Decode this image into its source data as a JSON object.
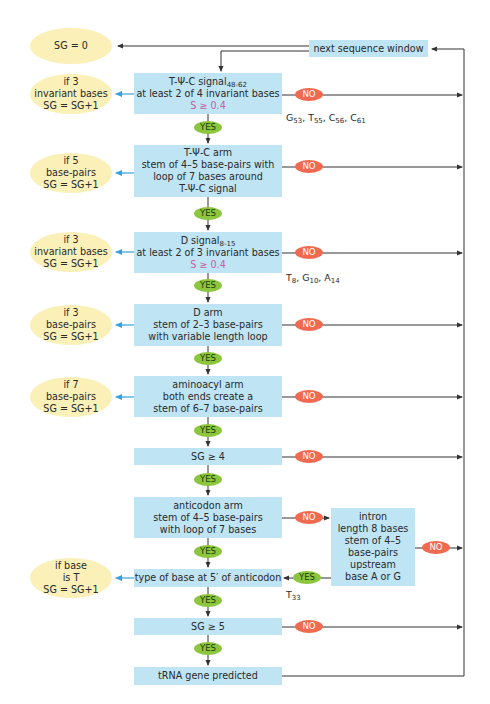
{
  "diagram": {
    "start": {
      "label": "SG = 0"
    },
    "next_window": {
      "label": "next sequence window"
    },
    "steps": [
      {
        "id": "tpsic-signal",
        "lines": [
          "T-Ψ-C signal",
          "at least 2 of 4 invariant bases",
          "S ≥ 0.4"
        ],
        "subscript": "48-62",
        "score_line": "S ≥ 0.4",
        "no_label": "NO",
        "yes_label": "YES",
        "note": "G53, T55, C56, C61",
        "side": {
          "lines": [
            "if 3",
            "invariant bases",
            "SG = SG+1"
          ]
        }
      },
      {
        "id": "tpsic-arm",
        "lines": [
          "T-Ψ-C arm",
          "stem of 4–5 base-pairs with",
          "loop of 7 bases around",
          "T-Ψ-C signal"
        ],
        "no_label": "NO",
        "yes_label": "YES",
        "side": {
          "lines": [
            "if 5",
            "base-pairs",
            "SG = SG+1"
          ]
        }
      },
      {
        "id": "d-signal",
        "lines": [
          "D signal",
          "at least 2 of 3 invariant bases",
          "S ≥ 0.4"
        ],
        "subscript": "8-15",
        "score_line": "S ≥ 0.4",
        "no_label": "NO",
        "yes_label": "YES",
        "note": "T8, G10, A14",
        "side": {
          "lines": [
            "if 3",
            "invariant bases",
            "SG = SG+1"
          ]
        }
      },
      {
        "id": "d-arm",
        "lines": [
          "D arm",
          "stem of 2–3 base-pairs",
          "with variable length loop"
        ],
        "no_label": "NO",
        "yes_label": "YES",
        "side": {
          "lines": [
            "if 3",
            "base-pairs",
            "SG = SG+1"
          ]
        }
      },
      {
        "id": "aminoacyl-arm",
        "lines": [
          "aminoacyl arm",
          "both ends create a",
          "stem of 6–7 base-pairs"
        ],
        "no_label": "NO",
        "yes_label": "YES",
        "side": {
          "lines": [
            "if 7",
            "base-pairs",
            "SG = SG+1"
          ]
        }
      },
      {
        "id": "sg-ge-4",
        "lines": [
          "SG ≥ 4"
        ],
        "no_label": "NO",
        "yes_label": "YES"
      },
      {
        "id": "anticodon-arm",
        "lines": [
          "anticodon arm",
          "stem of 4–5 base-pairs",
          "with loop of 7 bases"
        ],
        "no_label": "NO",
        "yes_label": "YES"
      },
      {
        "id": "base-5prime",
        "lines": [
          "type of base at 5′ of anticodon"
        ],
        "yes_label": "YES",
        "side": {
          "lines": [
            "if base",
            "is T",
            "SG = SG+1"
          ]
        }
      },
      {
        "id": "sg-ge-5",
        "lines": [
          "SG ≥ 5"
        ],
        "no_label": "NO",
        "yes_label": "YES"
      },
      {
        "id": "predicted",
        "lines": [
          "tRNA gene predicted"
        ]
      }
    ],
    "intron": {
      "lines": [
        "intron",
        "length 8 bases",
        "stem of 4–5",
        "base-pairs",
        "upstream",
        "base A or G"
      ],
      "no_label": "NO",
      "yes_label": "YES",
      "note": "T33"
    },
    "notes": {
      "tpsic": {
        "G": "G",
        "G_sub": "53",
        "T": "T",
        "T_sub": "55",
        "C1": "C",
        "C1_sub": "56",
        "C2": "C",
        "C2_sub": "61"
      },
      "d": {
        "T": "T",
        "T_sub": "8",
        "G": "G",
        "G_sub": "10",
        "A": "A",
        "A_sub": "14"
      },
      "intron": {
        "T": "T",
        "T_sub": "33"
      }
    },
    "colors": {
      "box": "#bfe4f4",
      "ellipse": "#faf0b8",
      "no": "#ef6a4f",
      "yes": "#8cc63f",
      "score": "#c5609e",
      "side_arrow": "#3aa0d8",
      "line": "#333333"
    }
  }
}
